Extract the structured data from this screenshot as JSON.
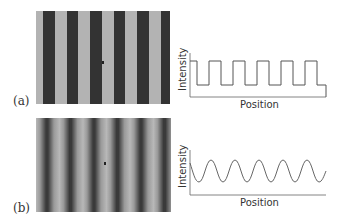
{
  "panels": [
    {
      "label": "(a)",
      "image": {
        "description": "sharp-edged stripe grating",
        "stripe_count": 6,
        "light_color": "#b3b3b3",
        "dark_color": "#333333",
        "edge": "sharp"
      },
      "graph": {
        "ylabel": "Intensity",
        "xlabel": "Position",
        "profile": "square-wave",
        "cycles": 5
      }
    },
    {
      "label": "(b)",
      "image": {
        "description": "blurred sinusoidal stripe grating",
        "stripe_count": 6,
        "light_color": "#b8b8b8",
        "dark_color": "#3a3a3a",
        "edge": "blurred"
      },
      "graph": {
        "ylabel": "Intensity",
        "xlabel": "Position",
        "profile": "sine-wave",
        "cycles": 5
      }
    }
  ],
  "colors": {
    "line": "#555555",
    "axis": "#666666"
  }
}
